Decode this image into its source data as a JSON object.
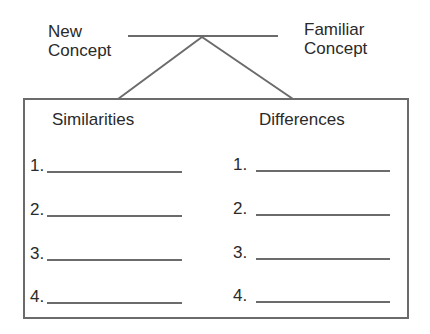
{
  "top": {
    "left_label": [
      "New",
      "Concept"
    ],
    "right_label": [
      "Familiar",
      "Concept"
    ]
  },
  "box": {
    "left_header": "Similarities",
    "right_header": "Differences",
    "left_items": [
      "1.",
      "2.",
      "3.",
      "4."
    ],
    "right_items": [
      "1.",
      "2.",
      "3.",
      "4."
    ]
  },
  "colors": {
    "line": "#6b6b6b",
    "text": "#2a2a2a"
  }
}
